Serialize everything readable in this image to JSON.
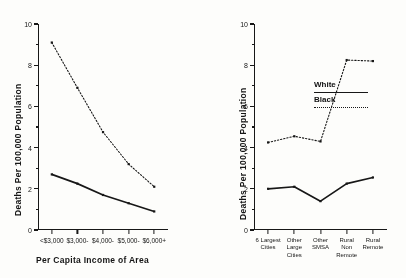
{
  "figure": {
    "background": "#fdfdfb",
    "ink": "#1c1c1c"
  },
  "legend": {
    "white_label": "White",
    "black_label": "Black",
    "white_style": "solid",
    "black_style": "dotted"
  },
  "axis": {
    "y_title": "Deaths Per 100,000 Population",
    "y_ticks": [
      "0",
      "2",
      "4",
      "6",
      "8",
      "10"
    ]
  },
  "chart_data": [
    {
      "type": "line",
      "title": "",
      "panel": "left",
      "xlabel": "Per Capita Income of Area",
      "ylabel": "Deaths Per 100,000 Population",
      "categories": [
        "<$3,000",
        "$3,000-",
        "$4,000-",
        "$5,000-",
        "$6,000+"
      ],
      "ylim": [
        0,
        10
      ],
      "yticks": [
        0,
        2,
        4,
        6,
        8,
        10
      ],
      "grid": false,
      "legend_position": "none",
      "series": [
        {
          "name": "Black",
          "style": "dotted",
          "values": [
            9.1,
            6.9,
            4.75,
            3.2,
            2.1
          ]
        },
        {
          "name": "White",
          "style": "solid",
          "values": [
            2.7,
            2.25,
            1.7,
            1.3,
            0.9
          ]
        }
      ]
    },
    {
      "type": "line",
      "title": "",
      "panel": "right",
      "xlabel": "",
      "ylabel": "Deaths Per 100,000 Population",
      "categories": [
        "6 Largest\nCities",
        "Other\nLarge\nCities",
        "Other\nSMSA",
        "Rural\nNon\nRemote",
        "Rural\nRemote"
      ],
      "ylim": [
        0,
        10
      ],
      "yticks": [
        0,
        2,
        4,
        6,
        8,
        10
      ],
      "grid": false,
      "legend_position": "upper-left",
      "series": [
        {
          "name": "Black",
          "style": "dotted",
          "values": [
            4.25,
            4.55,
            4.3,
            8.25,
            8.2
          ]
        },
        {
          "name": "White",
          "style": "solid",
          "values": [
            2.0,
            2.1,
            1.4,
            2.25,
            2.55
          ]
        }
      ]
    }
  ]
}
